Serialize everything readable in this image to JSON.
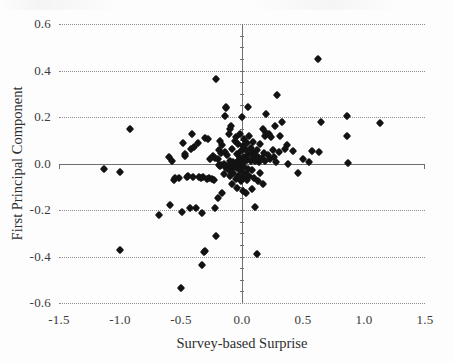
{
  "chart_data": {
    "type": "scatter",
    "title": "",
    "xlabel": "Survey-based Surprise",
    "ylabel": "First Principal Component",
    "xlim": [
      -1.5,
      1.5
    ],
    "ylim": [
      -0.6,
      0.6
    ],
    "xticks": [
      -1.5,
      -1.0,
      -0.5,
      0.0,
      0.5,
      1.0,
      1.5
    ],
    "xtick_labels": [
      "-1.5",
      "-1.0",
      "-0.5",
      "0.0",
      "0.5",
      "1.0",
      "1.5"
    ],
    "yticks": [
      0.6,
      0.4,
      0.2,
      0.0,
      -0.2,
      -0.4,
      -0.6
    ],
    "ytick_labels": [
      "0.6",
      "0.4",
      "0.2",
      "0.0",
      "-0.2",
      "-0.4",
      "-0.6"
    ],
    "grid": "horizontal-dotted",
    "legend": null,
    "marker": "diamond",
    "marker_color": "#131313",
    "axis_color": "#6f6f6f",
    "gridline_color": "#8d8d8d",
    "points": [
      [
        -1.13,
        -0.025
      ],
      [
        -1.0,
        -0.037
      ],
      [
        -1.0,
        -0.37
      ],
      [
        -0.92,
        0.15
      ],
      [
        -0.68,
        -0.222
      ],
      [
        -0.6,
        0.03
      ],
      [
        -0.59,
        -0.178
      ],
      [
        -0.57,
        0.012
      ],
      [
        -0.56,
        -0.073
      ],
      [
        -0.55,
        -0.062
      ],
      [
        -0.52,
        -0.062
      ],
      [
        -0.5,
        -0.535
      ],
      [
        -0.49,
        -0.21
      ],
      [
        -0.48,
        0.09
      ],
      [
        -0.47,
        0.032
      ],
      [
        -0.47,
        0.04
      ],
      [
        -0.45,
        -0.06
      ],
      [
        -0.44,
        -0.055
      ],
      [
        -0.43,
        -0.19
      ],
      [
        -0.42,
        0.062
      ],
      [
        -0.41,
        0.128
      ],
      [
        -0.4,
        -0.058
      ],
      [
        -0.39,
        0.072
      ],
      [
        -0.38,
        -0.19
      ],
      [
        -0.36,
        0.088
      ],
      [
        -0.35,
        -0.06
      ],
      [
        -0.34,
        -0.063
      ],
      [
        -0.33,
        -0.212
      ],
      [
        -0.33,
        -0.435
      ],
      [
        -0.32,
        -0.06
      ],
      [
        -0.31,
        -0.38
      ],
      [
        -0.3,
        -0.378
      ],
      [
        -0.3,
        0.11
      ],
      [
        -0.29,
        -0.065
      ],
      [
        -0.28,
        0.105
      ],
      [
        -0.27,
        -0.062
      ],
      [
        -0.26,
        0.02
      ],
      [
        -0.25,
        -0.068
      ],
      [
        -0.24,
        0.032
      ],
      [
        -0.23,
        -0.07
      ],
      [
        -0.22,
        -0.19
      ],
      [
        -0.22,
        0.022
      ],
      [
        -0.21,
        -0.31
      ],
      [
        -0.21,
        0.365
      ],
      [
        -0.2,
        0.018
      ],
      [
        -0.2,
        -0.148
      ],
      [
        -0.19,
        -0.008
      ],
      [
        -0.19,
        0.06
      ],
      [
        -0.18,
        -0.01
      ],
      [
        -0.18,
        0.098
      ],
      [
        -0.17,
        -0.005
      ],
      [
        -0.17,
        0.045
      ],
      [
        -0.16,
        -0.125
      ],
      [
        -0.16,
        0.078
      ],
      [
        -0.15,
        0.0
      ],
      [
        -0.15,
        -0.045
      ],
      [
        -0.14,
        0.048
      ],
      [
        -0.14,
        0.205
      ],
      [
        -0.13,
        -0.018
      ],
      [
        -0.13,
        0.24
      ],
      [
        -0.13,
        0.245
      ],
      [
        -0.12,
        -0.012
      ],
      [
        -0.12,
        0.035
      ],
      [
        -0.11,
        0.125
      ],
      [
        -0.11,
        -0.03
      ],
      [
        -0.1,
        0.01
      ],
      [
        -0.1,
        -0.055
      ],
      [
        -0.1,
        0.15
      ],
      [
        -0.09,
        -0.005
      ],
      [
        -0.09,
        0.16
      ],
      [
        -0.08,
        -0.022
      ],
      [
        -0.08,
        0.062
      ],
      [
        -0.08,
        -0.09
      ],
      [
        -0.07,
        0.005
      ],
      [
        -0.07,
        -0.04
      ],
      [
        -0.06,
        0.095
      ],
      [
        -0.06,
        -0.012
      ],
      [
        -0.05,
        0.002
      ],
      [
        -0.05,
        -0.065
      ],
      [
        -0.05,
        0.112
      ],
      [
        -0.04,
        -0.02
      ],
      [
        -0.04,
        0.042
      ],
      [
        -0.04,
        -0.105
      ],
      [
        -0.03,
        0.01
      ],
      [
        -0.03,
        0.085
      ],
      [
        -0.03,
        -0.052
      ],
      [
        -0.02,
        0.022
      ],
      [
        -0.02,
        -0.028
      ],
      [
        -0.02,
        0.128
      ],
      [
        -0.01,
        -0.008
      ],
      [
        -0.01,
        0.055
      ],
      [
        -0.01,
        -0.075
      ],
      [
        0.0,
        0.018
      ],
      [
        0.0,
        -0.038
      ],
      [
        0.0,
        0.2
      ],
      [
        0.01,
        0.002
      ],
      [
        0.01,
        0.075
      ],
      [
        0.01,
        -0.06
      ],
      [
        0.01,
        -0.118
      ],
      [
        0.02,
        0.03
      ],
      [
        0.02,
        -0.015
      ],
      [
        0.02,
        0.105
      ],
      [
        0.03,
        -0.045
      ],
      [
        0.03,
        0.06
      ],
      [
        0.03,
        -0.128
      ],
      [
        0.04,
        0.015
      ],
      [
        0.04,
        0.09
      ],
      [
        0.04,
        -0.07
      ],
      [
        0.05,
        0.035
      ],
      [
        0.05,
        -0.022
      ],
      [
        0.05,
        0.242
      ],
      [
        0.06,
        0.118
      ],
      [
        0.06,
        -0.052
      ],
      [
        0.07,
        0.01
      ],
      [
        0.07,
        0.068
      ],
      [
        0.08,
        -0.03
      ],
      [
        0.08,
        0.05
      ],
      [
        0.08,
        -0.108
      ],
      [
        0.09,
        0.025
      ],
      [
        0.09,
        0.092
      ],
      [
        0.1,
        -0.062
      ],
      [
        0.1,
        0.04
      ],
      [
        0.11,
        -0.188
      ],
      [
        0.11,
        0.012
      ],
      [
        0.12,
        -0.39
      ],
      [
        0.12,
        0.058
      ],
      [
        0.13,
        0.03
      ],
      [
        0.13,
        -0.075
      ],
      [
        0.14,
        0.005
      ],
      [
        0.15,
        0.082
      ],
      [
        0.15,
        -0.042
      ],
      [
        0.16,
        0.022
      ],
      [
        0.17,
        0.148
      ],
      [
        0.17,
        -0.09
      ],
      [
        0.18,
        0.045
      ],
      [
        0.19,
        0.118
      ],
      [
        0.19,
        0.01
      ],
      [
        0.2,
        0.13
      ],
      [
        0.2,
        0.212
      ],
      [
        0.21,
        0.035
      ],
      [
        0.22,
        0.125
      ],
      [
        0.23,
        0.02
      ],
      [
        0.24,
        0.112
      ],
      [
        0.25,
        0.06
      ],
      [
        0.26,
        0.028
      ],
      [
        0.27,
        0.16
      ],
      [
        0.28,
        0.008
      ],
      [
        0.29,
        0.295
      ],
      [
        0.3,
        0.048
      ],
      [
        0.31,
        0.118
      ],
      [
        0.33,
        0.18
      ],
      [
        0.35,
        0.062
      ],
      [
        0.37,
        0.078
      ],
      [
        0.38,
        -0.002
      ],
      [
        0.42,
        0.052
      ],
      [
        0.46,
        -0.04
      ],
      [
        0.5,
        0.018
      ],
      [
        0.55,
        0.005
      ],
      [
        0.57,
        0.055
      ],
      [
        0.62,
        0.45
      ],
      [
        0.63,
        0.048
      ],
      [
        0.65,
        0.18
      ],
      [
        0.86,
        0.12
      ],
      [
        0.86,
        0.205
      ],
      [
        0.87,
        0.002
      ],
      [
        1.13,
        0.175
      ]
    ]
  }
}
